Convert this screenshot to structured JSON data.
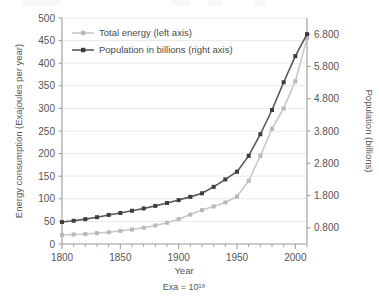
{
  "chart_data": {
    "type": "line",
    "title": "",
    "xlabel": "Year",
    "ylabel": "Energy consumption (Exajoules per year)",
    "y2label": "Population (billions)",
    "note": "Exa = 10¹⁸",
    "grid": true,
    "legend_position": "top-left",
    "xlim": [
      1800,
      2010
    ],
    "xticks": [
      1800,
      1850,
      1900,
      1950,
      2000
    ],
    "xtick_labels": [
      "1800",
      "1850",
      "1900",
      "1950",
      "2000"
    ],
    "xminor_step": 10,
    "ylim": [
      0,
      500
    ],
    "yticks": [
      0,
      50,
      100,
      150,
      200,
      250,
      300,
      350,
      400,
      450,
      500
    ],
    "ytick_labels": [
      "0",
      "50",
      "100",
      "150",
      "200",
      "250",
      "300",
      "350",
      "400",
      "450",
      "500"
    ],
    "y2lim": [
      0.3,
      7.3
    ],
    "y2ticks": [
      0.8,
      1.8,
      2.8,
      3.8,
      4.8,
      5.8,
      6.8
    ],
    "y2tick_labels": [
      "0.800",
      "1.800",
      "2.800",
      "3.800",
      "4.800",
      "5.800",
      "6.800"
    ],
    "x": [
      1800,
      1810,
      1820,
      1830,
      1840,
      1850,
      1860,
      1870,
      1880,
      1890,
      1900,
      1910,
      1920,
      1930,
      1940,
      1950,
      1960,
      1970,
      1980,
      1990,
      2000,
      2010
    ],
    "series": [
      {
        "name": "Total energy (left axis)",
        "axis": "left",
        "color": "#c8c8c8",
        "marker_color": "#b8b8b8",
        "values": [
          20,
          21,
          22,
          24,
          26,
          29,
          32,
          36,
          41,
          47,
          55,
          65,
          75,
          83,
          92,
          105,
          140,
          195,
          255,
          300,
          360,
          455
        ]
      },
      {
        "name": "Population in billions (right axis)",
        "axis": "right",
        "color": "#585858",
        "marker_color": "#3d3d3d",
        "values": [
          0.98,
          1.02,
          1.07,
          1.13,
          1.2,
          1.26,
          1.33,
          1.4,
          1.48,
          1.57,
          1.66,
          1.76,
          1.87,
          2.07,
          2.3,
          2.54,
          3.03,
          3.7,
          4.45,
          5.31,
          6.12,
          6.8
        ]
      }
    ]
  },
  "legend": {
    "items": [
      {
        "label": "Total energy (left axis)"
      },
      {
        "label": "Population in billions (right axis)"
      }
    ]
  }
}
